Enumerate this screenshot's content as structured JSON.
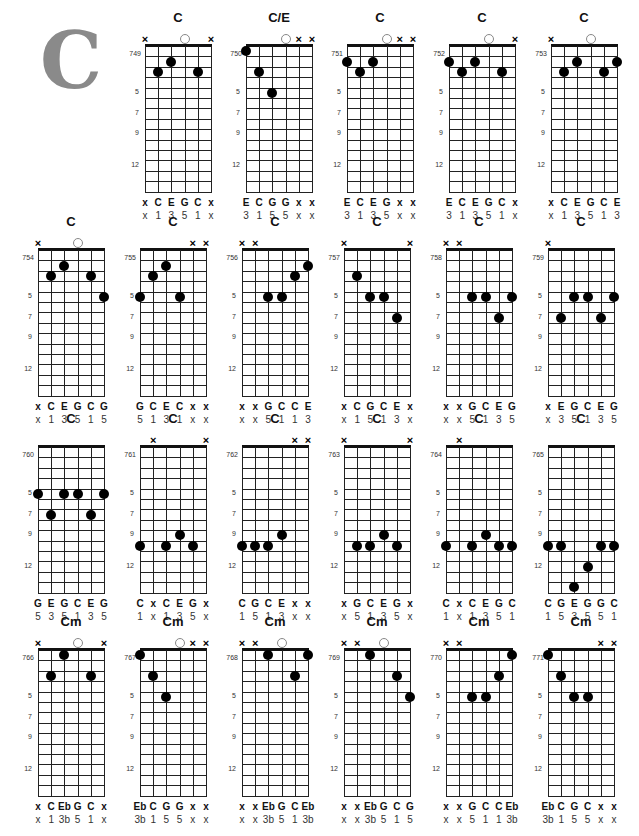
{
  "page": {
    "key_letter": "C",
    "accent_color": "#8a8a8a"
  },
  "layout": {
    "columns_x": [
      145,
      246,
      347,
      449,
      551
    ],
    "row_columns_x": [
      [
        145,
        246,
        347,
        449,
        551
      ],
      [
        38,
        140,
        242,
        344,
        446,
        548
      ],
      [
        38,
        140,
        242,
        344,
        446,
        548
      ],
      [
        38,
        140,
        242,
        344,
        446,
        548
      ]
    ],
    "rows_grid_top": [
      46,
      250,
      447,
      650
    ],
    "string_gap": 13.2,
    "fret_height": 10.4,
    "fret_rows": 14,
    "fret_markers": [
      5,
      7,
      9,
      12
    ]
  },
  "chords": [
    {
      "num": "749",
      "name": "C",
      "row": 0,
      "col": 0,
      "top": [
        "x",
        null,
        null,
        "o",
        null,
        "x"
      ],
      "dots": [
        [
          1,
          3
        ],
        [
          2,
          2
        ],
        [
          4,
          3
        ]
      ],
      "notes": [
        "x",
        "C",
        "E",
        "G",
        "C",
        "x"
      ],
      "fingers": [
        "x",
        "1",
        "3",
        "5",
        "1",
        "x"
      ]
    },
    {
      "num": "750",
      "name": "C/E",
      "row": 0,
      "col": 1,
      "top": [
        null,
        null,
        null,
        "o",
        "x",
        "x"
      ],
      "dots": [
        [
          0,
          1
        ],
        [
          1,
          3
        ],
        [
          2,
          5
        ]
      ],
      "notes": [
        "E",
        "C",
        "G",
        "G",
        "x",
        "x"
      ],
      "fingers": [
        "3",
        "1",
        "5",
        "5",
        "x",
        "x"
      ]
    },
    {
      "num": "751",
      "name": "C",
      "row": 0,
      "col": 2,
      "top": [
        null,
        null,
        null,
        "o",
        "x",
        "x"
      ],
      "dots": [
        [
          0,
          2
        ],
        [
          1,
          3
        ],
        [
          2,
          2
        ]
      ],
      "notes": [
        "E",
        "C",
        "E",
        "G",
        "x",
        "x"
      ],
      "fingers": [
        "3",
        "1",
        "3",
        "5",
        "x",
        "x"
      ]
    },
    {
      "num": "752",
      "name": "C",
      "row": 0,
      "col": 3,
      "top": [
        null,
        null,
        null,
        "o",
        null,
        "x"
      ],
      "dots": [
        [
          0,
          2
        ],
        [
          1,
          3
        ],
        [
          2,
          2
        ],
        [
          4,
          3
        ]
      ],
      "notes": [
        "E",
        "C",
        "E",
        "G",
        "C",
        "x"
      ],
      "fingers": [
        "3",
        "1",
        "3",
        "5",
        "1",
        "x"
      ]
    },
    {
      "num": "753",
      "name": "C",
      "row": 0,
      "col": 4,
      "top": [
        "x",
        null,
        null,
        "o",
        null,
        null
      ],
      "dots": [
        [
          1,
          3
        ],
        [
          2,
          2
        ],
        [
          4,
          3
        ],
        [
          5,
          2
        ]
      ],
      "notes": [
        "x",
        "C",
        "E",
        "G",
        "C",
        "E"
      ],
      "fingers": [
        "x",
        "1",
        "3",
        "5",
        "1",
        "3"
      ]
    },
    {
      "num": "754",
      "name": "C",
      "row": 1,
      "col": 0,
      "top": [
        "x",
        null,
        null,
        "o",
        null,
        null
      ],
      "dots": [
        [
          1,
          3
        ],
        [
          2,
          2
        ],
        [
          4,
          3
        ],
        [
          5,
          5
        ]
      ],
      "notes": [
        "x",
        "C",
        "E",
        "G",
        "C",
        "G"
      ],
      "fingers": [
        "x",
        "1",
        "3",
        "5",
        "1",
        "5"
      ]
    },
    {
      "num": "755",
      "name": "C",
      "row": 1,
      "col": 1,
      "top": [
        null,
        null,
        null,
        null,
        "x",
        "x"
      ],
      "dots": [
        [
          0,
          5
        ],
        [
          1,
          3
        ],
        [
          2,
          2
        ],
        [
          3,
          5
        ]
      ],
      "notes": [
        "G",
        "C",
        "E",
        "C",
        "x",
        "x"
      ],
      "fingers": [
        "5",
        "1",
        "3",
        "1",
        "x",
        "x"
      ]
    },
    {
      "num": "756",
      "name": "C",
      "row": 1,
      "col": 2,
      "top": [
        "x",
        "x",
        null,
        null,
        null,
        null
      ],
      "dots": [
        [
          2,
          5
        ],
        [
          3,
          5
        ],
        [
          4,
          3
        ],
        [
          5,
          2
        ]
      ],
      "notes": [
        "x",
        "x",
        "G",
        "C",
        "C",
        "E"
      ],
      "fingers": [
        "x",
        "x",
        "5",
        "1",
        "1",
        "3"
      ]
    },
    {
      "num": "757",
      "name": "C",
      "row": 1,
      "col": 3,
      "top": [
        "x",
        null,
        null,
        null,
        null,
        "x"
      ],
      "dots": [
        [
          1,
          3
        ],
        [
          2,
          5
        ],
        [
          3,
          5
        ],
        [
          4,
          7
        ]
      ],
      "notes": [
        "x",
        "C",
        "G",
        "C",
        "E",
        "x"
      ],
      "fingers": [
        "x",
        "1",
        "5",
        "1",
        "3",
        "x"
      ]
    },
    {
      "num": "758",
      "name": "C",
      "row": 1,
      "col": 4,
      "top": [
        "x",
        "x",
        null,
        null,
        null,
        null
      ],
      "dots": [
        [
          2,
          5
        ],
        [
          3,
          5
        ],
        [
          4,
          7
        ],
        [
          5,
          5
        ]
      ],
      "notes": [
        "x",
        "x",
        "G",
        "C",
        "E",
        "G"
      ],
      "fingers": [
        "x",
        "x",
        "5",
        "1",
        "3",
        "5"
      ]
    },
    {
      "num": "759",
      "name": "C",
      "row": 1,
      "col": 5,
      "top": [
        "x",
        null,
        null,
        null,
        null,
        null
      ],
      "dots": [
        [
          1,
          7
        ],
        [
          2,
          5
        ],
        [
          3,
          5
        ],
        [
          4,
          7
        ],
        [
          5,
          5
        ]
      ],
      "notes": [
        "x",
        "E",
        "G",
        "C",
        "E",
        "G"
      ],
      "fingers": [
        "x",
        "3",
        "5",
        "1",
        "3",
        "5"
      ]
    },
    {
      "num": "760",
      "name": "C",
      "row": 2,
      "col": 0,
      "top": [
        null,
        null,
        null,
        null,
        null,
        null
      ],
      "dots": [
        [
          0,
          5
        ],
        [
          1,
          7
        ],
        [
          2,
          5
        ],
        [
          3,
          5
        ],
        [
          4,
          7
        ],
        [
          5,
          5
        ]
      ],
      "notes": [
        "G",
        "E",
        "G",
        "C",
        "E",
        "G"
      ],
      "fingers": [
        "5",
        "3",
        "5",
        "1",
        "3",
        "5"
      ]
    },
    {
      "num": "761",
      "name": "C",
      "row": 2,
      "col": 1,
      "top": [
        null,
        "x",
        null,
        null,
        null,
        "x"
      ],
      "dots": [
        [
          0,
          10
        ],
        [
          2,
          10
        ],
        [
          3,
          9
        ],
        [
          4,
          10
        ]
      ],
      "notes": [
        "C",
        "x",
        "C",
        "E",
        "G",
        "x"
      ],
      "fingers": [
        "1",
        "x",
        "1",
        "3",
        "5",
        "x"
      ]
    },
    {
      "num": "762",
      "name": "C",
      "row": 2,
      "col": 2,
      "top": [
        null,
        null,
        null,
        null,
        "x",
        "x"
      ],
      "dots": [
        [
          0,
          10
        ],
        [
          1,
          10
        ],
        [
          2,
          10
        ],
        [
          3,
          9
        ]
      ],
      "notes": [
        "C",
        "G",
        "C",
        "E",
        "x",
        "x"
      ],
      "fingers": [
        "1",
        "5",
        "1",
        "3",
        "x",
        "x"
      ]
    },
    {
      "num": "763",
      "name": "C",
      "row": 2,
      "col": 3,
      "top": [
        "x",
        null,
        null,
        null,
        null,
        "x"
      ],
      "dots": [
        [
          1,
          10
        ],
        [
          2,
          10
        ],
        [
          3,
          9
        ],
        [
          4,
          10
        ]
      ],
      "notes": [
        "x",
        "G",
        "C",
        "E",
        "G",
        "x"
      ],
      "fingers": [
        "x",
        "5",
        "1",
        "3",
        "5",
        "x"
      ]
    },
    {
      "num": "764",
      "name": "C",
      "row": 2,
      "col": 4,
      "top": [
        null,
        "x",
        null,
        null,
        null,
        null
      ],
      "dots": [
        [
          0,
          10
        ],
        [
          2,
          10
        ],
        [
          3,
          9
        ],
        [
          4,
          10
        ],
        [
          5,
          10
        ]
      ],
      "notes": [
        "C",
        "x",
        "C",
        "E",
        "G",
        "C"
      ],
      "fingers": [
        "1",
        "x",
        "1",
        "3",
        "5",
        "1"
      ]
    },
    {
      "num": "765",
      "name": "C",
      "row": 2,
      "col": 5,
      "top": [
        null,
        null,
        null,
        null,
        null,
        null
      ],
      "dots": [
        [
          0,
          10
        ],
        [
          1,
          10
        ],
        [
          2,
          14
        ],
        [
          3,
          12
        ],
        [
          4,
          10
        ],
        [
          5,
          10
        ]
      ],
      "notes": [
        "C",
        "G",
        "E",
        "G",
        "G",
        "C"
      ],
      "fingers": [
        "1",
        "5",
        "3",
        "5",
        "5",
        "1"
      ]
    },
    {
      "num": "766",
      "name": "Cm",
      "row": 3,
      "col": 0,
      "top": [
        "x",
        null,
        null,
        "o",
        null,
        "x"
      ],
      "dots": [
        [
          1,
          3
        ],
        [
          2,
          1
        ],
        [
          4,
          3
        ]
      ],
      "notes": [
        "x",
        "C",
        "Eb",
        "G",
        "C",
        "x"
      ],
      "fingers": [
        "x",
        "1",
        "3b",
        "5",
        "1",
        "x"
      ]
    },
    {
      "num": "767",
      "name": "Cm",
      "row": 3,
      "col": 1,
      "top": [
        null,
        null,
        null,
        "o",
        "x",
        "x"
      ],
      "dots": [
        [
          0,
          1
        ],
        [
          1,
          3
        ],
        [
          2,
          5
        ]
      ],
      "notes": [
        "Eb",
        "C",
        "G",
        "G",
        "x",
        "x"
      ],
      "fingers": [
        "3b",
        "1",
        "5",
        "5",
        "x",
        "x"
      ]
    },
    {
      "num": "768",
      "name": "Cm",
      "row": 3,
      "col": 2,
      "top": [
        "x",
        "x",
        null,
        "o",
        null,
        null
      ],
      "dots": [
        [
          2,
          1
        ],
        [
          4,
          3
        ],
        [
          5,
          1
        ]
      ],
      "notes": [
        "x",
        "x",
        "Eb",
        "G",
        "C",
        "Eb"
      ],
      "fingers": [
        "x",
        "x",
        "3b",
        "5",
        "1",
        "3b"
      ]
    },
    {
      "num": "769",
      "name": "Cm",
      "row": 3,
      "col": 3,
      "top": [
        "x",
        "x",
        null,
        "o",
        null,
        null
      ],
      "dots": [
        [
          2,
          1
        ],
        [
          4,
          3
        ],
        [
          5,
          5
        ]
      ],
      "notes": [
        "x",
        "x",
        "Eb",
        "G",
        "C",
        "G"
      ],
      "fingers": [
        "x",
        "x",
        "3b",
        "5",
        "1",
        "5"
      ]
    },
    {
      "num": "770",
      "name": "Cm",
      "row": 3,
      "col": 4,
      "top": [
        "x",
        "x",
        null,
        null,
        null,
        null
      ],
      "dots": [
        [
          2,
          5
        ],
        [
          3,
          5
        ],
        [
          4,
          3
        ],
        [
          5,
          1
        ]
      ],
      "notes": [
        "x",
        "x",
        "G",
        "C",
        "C",
        "Eb"
      ],
      "fingers": [
        "x",
        "x",
        "5",
        "1",
        "1",
        "3b"
      ]
    },
    {
      "num": "771",
      "name": "Cm",
      "row": 3,
      "col": 5,
      "top": [
        null,
        null,
        null,
        null,
        "x",
        "x"
      ],
      "dots": [
        [
          0,
          1
        ],
        [
          1,
          3
        ],
        [
          2,
          5
        ],
        [
          3,
          5
        ]
      ],
      "notes": [
        "Eb",
        "C",
        "G",
        "C",
        "x",
        "x"
      ],
      "fingers": [
        "3b",
        "1",
        "5",
        "5",
        "x",
        "x"
      ]
    }
  ]
}
